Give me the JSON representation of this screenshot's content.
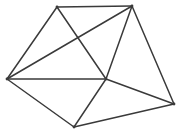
{
  "diagram": {
    "type": "node-link-diagram",
    "background_color": "#ffffff",
    "edge_color": "#3a3a3a",
    "edge_width": 1.5,
    "vertex_color": "#3a3a3a",
    "vertex_radius": 1.4,
    "canvas": {
      "width": 180,
      "height": 135
    },
    "vertex_count": "6",
    "edge_count": "11",
    "vertices": [
      {
        "id": "top-left",
        "label": "",
        "x": 57,
        "y": 7
      },
      {
        "id": "top-right",
        "label": "",
        "x": 132,
        "y": 6
      },
      {
        "id": "left",
        "label": "",
        "x": 7,
        "y": 79
      },
      {
        "id": "center",
        "label": "",
        "x": 106,
        "y": 79
      },
      {
        "id": "bottom",
        "label": "",
        "x": 74,
        "y": 127
      },
      {
        "id": "right",
        "label": "",
        "x": 174,
        "y": 104
      }
    ],
    "edges": [
      {
        "id": "edge-tl-tr",
        "from": "top-left",
        "to": "top-right",
        "x1": 57,
        "y1": 7,
        "x2": 132,
        "y2": 6
      },
      {
        "id": "edge-tl-left",
        "from": "top-left",
        "to": "left",
        "x1": 57,
        "y1": 7,
        "x2": 7,
        "y2": 79
      },
      {
        "id": "edge-tl-center",
        "from": "top-left",
        "to": "center",
        "x1": 57,
        "y1": 7,
        "x2": 106,
        "y2": 79
      },
      {
        "id": "edge-tr-left",
        "from": "top-right",
        "to": "left",
        "x1": 132,
        "y1": 6,
        "x2": 7,
        "y2": 79
      },
      {
        "id": "edge-tr-center",
        "from": "top-right",
        "to": "center",
        "x1": 132,
        "y1": 6,
        "x2": 106,
        "y2": 79
      },
      {
        "id": "edge-tr-right",
        "from": "top-right",
        "to": "right",
        "x1": 132,
        "y1": 6,
        "x2": 174,
        "y2": 104
      },
      {
        "id": "edge-left-center",
        "from": "left",
        "to": "center",
        "x1": 7,
        "y1": 79,
        "x2": 106,
        "y2": 79
      },
      {
        "id": "edge-left-bottom",
        "from": "left",
        "to": "bottom",
        "x1": 7,
        "y1": 79,
        "x2": 74,
        "y2": 127
      },
      {
        "id": "edge-center-bottom",
        "from": "center",
        "to": "bottom",
        "x1": 106,
        "y1": 79,
        "x2": 74,
        "y2": 127
      },
      {
        "id": "edge-center-right",
        "from": "center",
        "to": "right",
        "x1": 106,
        "y1": 79,
        "x2": 174,
        "y2": 104
      },
      {
        "id": "edge-bottom-right",
        "from": "bottom",
        "to": "right",
        "x1": 74,
        "y1": 127,
        "x2": 174,
        "y2": 104
      }
    ]
  }
}
